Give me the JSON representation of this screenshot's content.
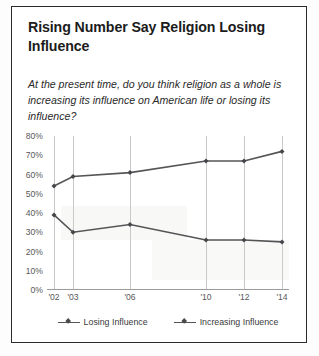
{
  "figure": {
    "title": "Rising Number Say Religion Losing Influence",
    "subtitle": "At the present time, do you think religion as a whole is increasing its influence on American life or losing its influence?",
    "border_color": "#2b2b2b",
    "background": "#ffffff"
  },
  "chart_data": {
    "type": "line",
    "title": "Rising Number Say Religion Losing Influence",
    "subtitle": "At the present time, do you think religion as a whole is increasing its influence on American life or losing its influence?",
    "xlabel": "",
    "ylabel": "",
    "categories": [
      "'02",
      "'03",
      "'06",
      "'10",
      "'12",
      "'14"
    ],
    "x": [
      2002,
      2003,
      2006,
      2010,
      2012,
      2014
    ],
    "ylim": [
      0,
      80
    ],
    "yticks": [
      0,
      10,
      20,
      30,
      40,
      50,
      60,
      70,
      80
    ],
    "ytick_labels": [
      "0%",
      "10%",
      "20%",
      "30%",
      "40%",
      "50%",
      "60%",
      "70%",
      "80%"
    ],
    "grid": "vertical",
    "legend_position": "bottom",
    "series": [
      {
        "name": "Losing Influence",
        "color": "#555557",
        "marker": "diamond",
        "values": [
          54,
          59,
          61,
          67,
          67,
          72
        ]
      },
      {
        "name": "Increasing Influence",
        "color": "#555557",
        "marker": "diamond",
        "values": [
          39,
          30,
          34,
          26,
          26,
          25
        ]
      }
    ]
  },
  "legend": {
    "items": [
      {
        "label": "Losing Influence"
      },
      {
        "label": "Increasing Influence"
      }
    ]
  }
}
